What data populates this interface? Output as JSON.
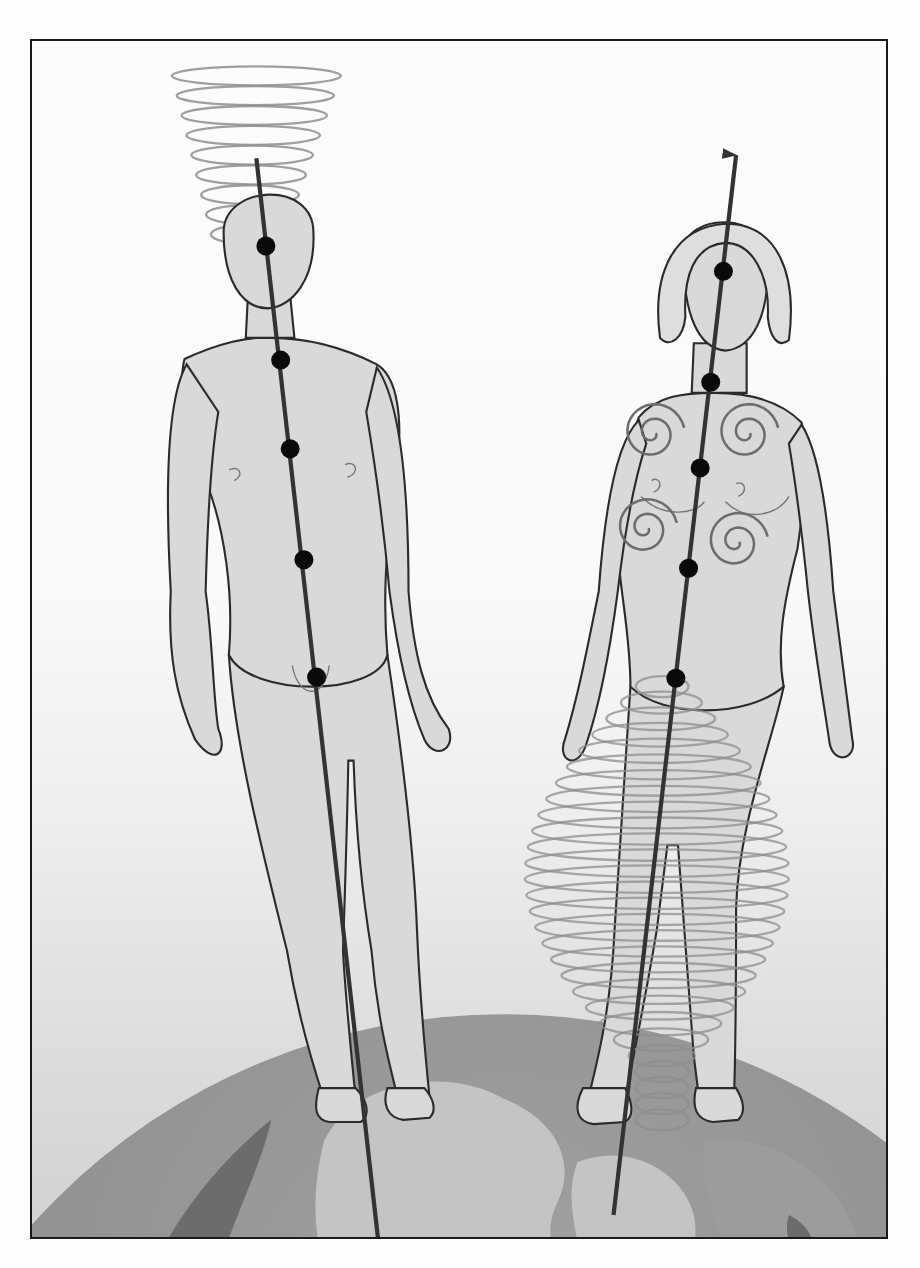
{
  "figure": {
    "title": "",
    "frame": {
      "x": 30,
      "y": 39,
      "width": 858,
      "height": 1200,
      "border_color": "#1a1a1a"
    },
    "colors": {
      "background_top": "#fcfcfc",
      "background_bottom": "#d2d2d2",
      "skin": "#d9d9d9",
      "outline": "#2b2b2b",
      "axis": "#333333",
      "dot": "#0a0a0a",
      "spiral": "#8e8e8e",
      "globe_ocean": "#8a8a8a",
      "globe_land": "#c4c4c4",
      "globe_dark": "#6c6c6c"
    },
    "figures": [
      {
        "id": "male",
        "label": "male-figure",
        "axis": {
          "x1": 236,
          "y1": 150,
          "x2": 352,
          "y2": 1180,
          "arrow_direction": "down"
        },
        "dots": [
          {
            "cx": 245,
            "cy": 233
          },
          {
            "cx": 259,
            "cy": 341
          },
          {
            "cx": 268,
            "cy": 425
          },
          {
            "cx": 281,
            "cy": 530
          },
          {
            "cx": 293,
            "cy": 641
          }
        ],
        "vortex": {
          "location": "above-head",
          "cx": 228,
          "top": 72,
          "bottom": 222,
          "rings": 9,
          "top_rx": 80,
          "bottom_rx": 35
        }
      },
      {
        "id": "female",
        "label": "female-figure",
        "axis": {
          "x1": 574,
          "y1": 1150,
          "x2": 690,
          "y2": 147,
          "arrow_direction": "up"
        },
        "dots": [
          {
            "cx": 678,
            "cy": 257
          },
          {
            "cx": 666,
            "cy": 362
          },
          {
            "cx": 656,
            "cy": 443
          },
          {
            "cx": 645,
            "cy": 538
          },
          {
            "cx": 633,
            "cy": 642
          }
        ],
        "vortex": {
          "location": "around-legs",
          "cx": 620,
          "top": 650,
          "bottom": 1060,
          "rings": 28,
          "max_rx": 125
        },
        "chest_spirals": [
          {
            "cx": 611,
            "cy": 410
          },
          {
            "cx": 700,
            "cy": 410
          },
          {
            "cx": 604,
            "cy": 500
          },
          {
            "cx": 690,
            "cy": 513
          }
        ]
      }
    ],
    "globe": {
      "cx": 470,
      "cy": 1560,
      "r": 600
    }
  }
}
